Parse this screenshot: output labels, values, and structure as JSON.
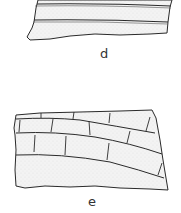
{
  "figure": {
    "panels": [
      {
        "id": "d",
        "label": "d"
      },
      {
        "id": "e",
        "label": "e"
      }
    ],
    "colors": {
      "stroke": "#2a2a2a",
      "fill": "#f1f1f1"
    }
  }
}
